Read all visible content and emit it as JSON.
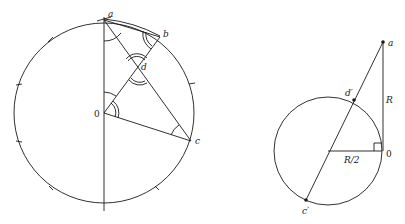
{
  "left_diagram": {
    "labels": {
      "a": "a",
      "b": "b",
      "d": "d",
      "origin": "0",
      "c": "c"
    },
    "tick_marks_count": 8
  },
  "right_diagram": {
    "labels": {
      "a": "a",
      "d_prime": "d′",
      "origin": "0",
      "c_prime": "c′",
      "radius": "R",
      "half_radius": "R/2"
    }
  }
}
